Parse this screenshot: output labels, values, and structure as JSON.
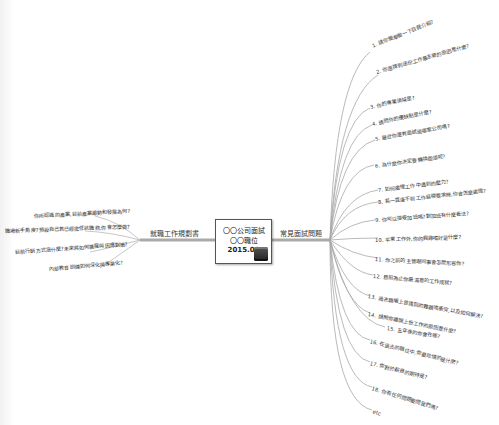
{
  "center": {
    "line1": "〇〇公司面試",
    "line2": "〇〇職位",
    "date": "2015.06",
    "icon": "briefcase-icon"
  },
  "left_branch": {
    "label": "就職工作規劃書",
    "items": [
      "你所認識的產業,目前產業趨勢和發展為何?",
      "職場新手角度?預設自己若已經擔任該職務,你會怎麼做?",
      "目前行銷方式是什麼?未來將如何擴展與因應對策?",
      "內部教育訓練如何深化與專業化?"
    ]
  },
  "right_branch": {
    "label": "常見面試問題",
    "items": [
      "1. 請你簡單做一下自我介紹?",
      "2. 你選擇到這份工作最主要的原因是什麼?",
      "3. 你的專業領域是?",
      "4. 請問你的優缺點是什麼?",
      "5. 最近你還有面試過哪家公司嗎?",
      "6. 為什麼你決定要轉換跑道呢?",
      "7. 如何處理工作中遇到的壓力?",
      "8. 若一直達不到工作目標要求時,你會怎麼處理?",
      "9. 你可以接受加班嗎?對加班有什麼看法?",
      "10. 平常工作外,你的興趣嗜好是什麼?",
      "11. 你之前的主管跟同事會怎麼形容你?",
      "12. 目前為止你最滿意的工作成就?",
      "13. 過去職場上曾遇到的難題或衝突,以及如何解決?",
      "14. 請問你離開上份工作的原因是什麼?",
      "15. 五年後的你會在哪?",
      "16. 在過去的職位中,你最珍惜的是什麼?",
      "17. 你對於薪資的期待是?",
      "18. 你有任何問題要問我們嗎?",
      "etc"
    ]
  },
  "colors": {
    "line": "#9a9a9a",
    "text": "#333333",
    "border": "#555555"
  }
}
